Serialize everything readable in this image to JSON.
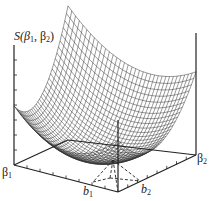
{
  "figure": {
    "type": "3d-surface",
    "colors": {
      "ink": "#222222",
      "background": "#ffffff"
    }
  },
  "labels": {
    "z_axis": "S(β",
    "z_axis_sub1": "1",
    "z_axis_mid": ", β",
    "z_axis_sub2": "2",
    "z_axis_end": ")",
    "x_axis_sym": "β",
    "x_axis_sub": "1",
    "y_axis_sym": "β",
    "y_axis_sub": "2",
    "min_x_sym": "b",
    "min_x_sub": "1",
    "min_y_sym": "b",
    "min_y_sub": "2"
  }
}
